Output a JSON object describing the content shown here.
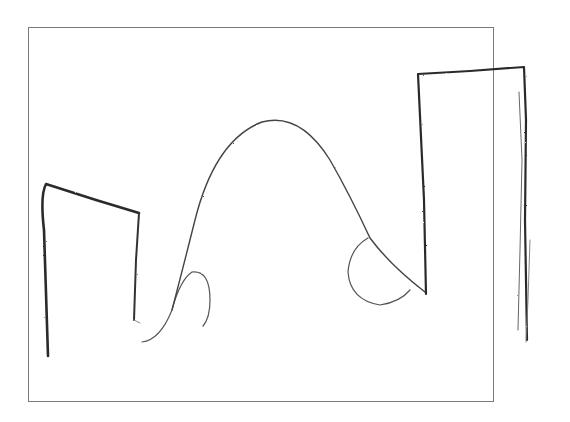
{
  "canvas": {
    "width": 570,
    "height": 422,
    "background": "#ffffff",
    "frame_color": "#7a7a7a"
  },
  "drawing": {
    "style": "pencil sketch",
    "stroke_color": "#2b2b2b",
    "shapes": [
      {
        "name": "left-tower",
        "kind": "open-rectangle"
      },
      {
        "name": "left-small-arc",
        "kind": "curve"
      },
      {
        "name": "central-arch",
        "kind": "curve"
      },
      {
        "name": "right-half-circle",
        "kind": "curve"
      },
      {
        "name": "right-tower",
        "kind": "open-rectangle"
      },
      {
        "name": "right-edge-scribbles",
        "kind": "lines"
      }
    ]
  }
}
